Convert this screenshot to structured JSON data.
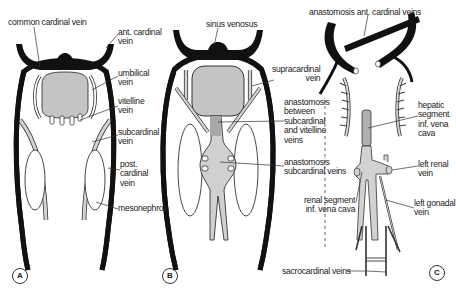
{
  "figure": {
    "colors": {
      "vessel_dark": "#111111",
      "vessel_light": "#cfcfcf",
      "organ_fill": "#c4c4c4",
      "line": "#333333"
    }
  },
  "panels": [
    {
      "id": "A",
      "marker": "A",
      "labels": {
        "common_cardinal": "common cardinal vein",
        "ant_cardinal": "ant. cardinal\nvein",
        "umbilical": "umbilical\nvein",
        "vitelline": "vitelline\nvein",
        "subcardinal": "subcardinal\nvein",
        "post_cardinal": "post.\ncardinal\nvein",
        "mesonephros": "mesonephros"
      }
    },
    {
      "id": "B",
      "marker": "B",
      "labels": {
        "sinus_venosus": "sinus venosus",
        "supracardinal": "supracardinal\nvein",
        "anast_sub_vit": "anastomosis\nbetween\nsubcardinal\nand vitelline\nveins",
        "anast_subcardinal": "anastomosis\nsubcardinal veins"
      }
    },
    {
      "id": "C",
      "marker": "C",
      "labels": {
        "anast_ant_cardinal": "anastomosis ant. cardinal veins",
        "hepatic_segment": "hepatic\nsegment\ninf. vena\ncava",
        "left_renal": "left renal\nvein",
        "renal_segment": "renal segment\ninf. vena cava",
        "left_gonadal": "left gonadal\nvein",
        "sacrocardinal": "sacrocardinal veins"
      }
    }
  ]
}
